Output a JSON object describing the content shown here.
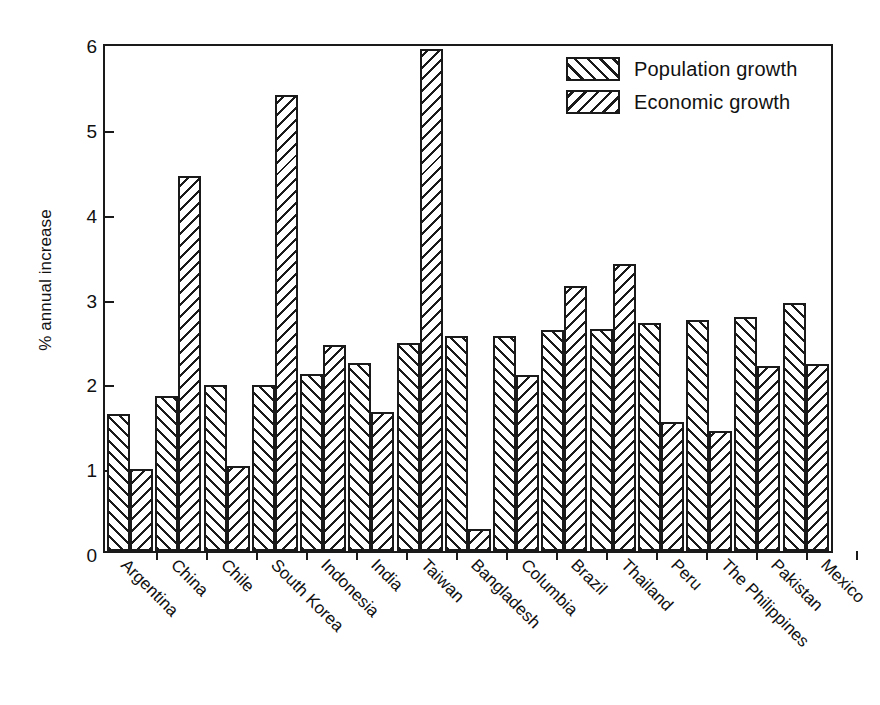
{
  "chart_data": {
    "type": "bar",
    "title": "",
    "subtitle": "",
    "xlabel": "",
    "ylabel": "% annual increase",
    "ylim": [
      0,
      6
    ],
    "yticks": [
      0,
      1,
      2,
      3,
      4,
      5,
      6
    ],
    "ytick_labels": [
      "0",
      "1",
      "2",
      "3",
      "4",
      "5",
      "6"
    ],
    "grid": false,
    "legend_position": "top-right",
    "bar_style": {
      "population_hatch": "forward-slash",
      "economic_hatch": "back-slash",
      "edge_color": "#1a1a1a",
      "fill_color": "#ffffff"
    },
    "categories": [
      "Argentina",
      "China",
      "Chile",
      "South Korea",
      "Indonesia",
      "India",
      "Taiwan",
      "Bangladesh",
      "Columbia",
      "Brazil",
      "Thailand",
      "Peru",
      "The Philippines",
      "Pakistan",
      "Mexico"
    ],
    "series": [
      {
        "name": "Population growth",
        "values": [
          1.62,
          1.83,
          1.96,
          1.96,
          2.09,
          2.22,
          2.45,
          2.53,
          2.53,
          2.61,
          2.62,
          2.69,
          2.72,
          2.76,
          2.92
        ]
      },
      {
        "name": "Economic growth",
        "values": [
          0.97,
          4.42,
          1.0,
          5.37,
          2.43,
          1.64,
          5.92,
          0.26,
          2.07,
          3.12,
          3.38,
          1.52,
          1.41,
          2.18,
          2.2
        ]
      }
    ]
  },
  "legend": {
    "items": [
      {
        "label": "Population growth",
        "hatch": "forward-slash"
      },
      {
        "label": "Economic growth",
        "hatch": "back-slash"
      }
    ]
  },
  "axes": {
    "y_title": "% annual increase"
  }
}
